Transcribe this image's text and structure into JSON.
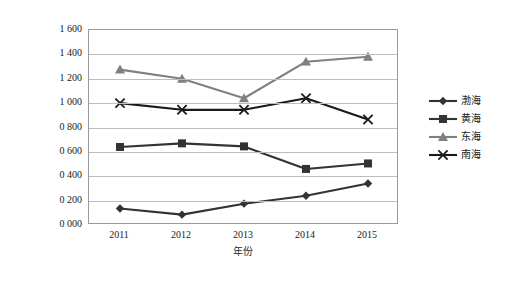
{
  "chart_data": {
    "type": "line",
    "title": "",
    "xlabel": "年份",
    "ylabel": "总磷排放量/（t/a）",
    "categories": [
      "2011",
      "2012",
      "2013",
      "2014",
      "2015"
    ],
    "x": [
      2011,
      2012,
      2013,
      2014,
      2015
    ],
    "ylim": [
      0,
      1600
    ],
    "ytick_values": [
      0,
      200,
      400,
      600,
      800,
      1000,
      1200,
      1400,
      1600
    ],
    "ytick_labels": [
      "0 000",
      "0 200",
      "0 400",
      "0 600",
      "0 800",
      "1 000",
      "1 200",
      "1 400",
      "1 600"
    ],
    "grid": true,
    "legend_position": "right-outside",
    "series": [
      {
        "name": "渤海",
        "marker": "diamond",
        "color": "#333333",
        "values": [
          135,
          85,
          175,
          240,
          340
        ]
      },
      {
        "name": "黄海",
        "marker": "square",
        "color": "#333333",
        "values": [
          640,
          670,
          645,
          460,
          505
        ]
      },
      {
        "name": "东海",
        "marker": "triangle",
        "color": "#808080",
        "values": [
          1275,
          1200,
          1040,
          1340,
          1380
        ]
      },
      {
        "name": "南海",
        "marker": "cross",
        "color": "#1a1a1a",
        "values": [
          1000,
          945,
          945,
          1040,
          865
        ]
      }
    ]
  },
  "legend": {
    "items": [
      {
        "label": "渤海",
        "marker": "diamond",
        "color": "#333333"
      },
      {
        "label": "黄海",
        "marker": "square",
        "color": "#333333"
      },
      {
        "label": "东海",
        "marker": "triangle",
        "color": "#808080"
      },
      {
        "label": "南海",
        "marker": "cross",
        "color": "#1a1a1a"
      }
    ]
  },
  "caption": ""
}
